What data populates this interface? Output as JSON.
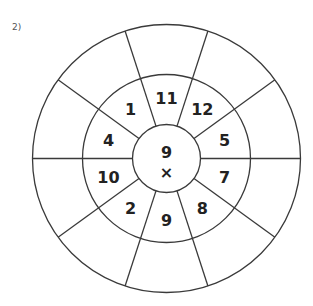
{
  "problem_label": "2)",
  "wheel": {
    "center": {
      "x": 166.5,
      "y": 158.5
    },
    "radii": {
      "inner": 34,
      "middle": 84,
      "outer": 134
    },
    "sector_count": 10,
    "spoke_start_angle_deg": 0,
    "line_color": "#3a3a3a",
    "center_values": {
      "top": "9",
      "bottom": "×"
    },
    "sectors": [
      {
        "angle_deg": 90,
        "value": "11"
      },
      {
        "angle_deg": 54,
        "value": "12"
      },
      {
        "angle_deg": 18,
        "value": "5"
      },
      {
        "angle_deg": -18,
        "value": "7"
      },
      {
        "angle_deg": -54,
        "value": "8"
      },
      {
        "angle_deg": -90,
        "value": "9"
      },
      {
        "angle_deg": -126,
        "value": "2"
      },
      {
        "angle_deg": -162,
        "value": "10"
      },
      {
        "angle_deg": 162,
        "value": "4"
      },
      {
        "angle_deg": 126,
        "value": "1"
      }
    ],
    "outer_answers": [
      "",
      "",
      "",
      "",
      "",
      "",
      "",
      "",
      "",
      ""
    ]
  }
}
